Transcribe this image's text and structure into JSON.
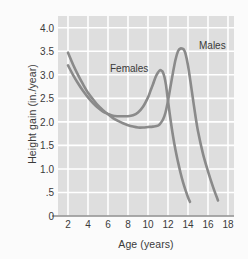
{
  "chart_data": {
    "type": "line",
    "title": "",
    "xlabel": "Age (years)",
    "ylabel": "Height gain (in./year)",
    "xlim": [
      1,
      18.6
    ],
    "ylim": [
      0,
      4.25
    ],
    "xticks": [
      "2",
      "4",
      "6",
      "8",
      "10",
      "12",
      "14",
      "16",
      "18"
    ],
    "xtick_values": [
      2,
      4,
      6,
      8,
      10,
      12,
      14,
      16,
      18
    ],
    "yticks": [
      "0",
      ".5",
      "1.0",
      "1.5",
      "2.0",
      "2.5",
      "3.0",
      "3.5",
      "4.0"
    ],
    "ytick_values": [
      0,
      0.5,
      1.0,
      1.5,
      2.0,
      2.5,
      3.0,
      3.5,
      4.0
    ],
    "grid": true,
    "grid_color": "#ffffff",
    "plot_background": "#dedede",
    "line_color": "#8a8a8a",
    "legend_position": "inline-annotations",
    "series": [
      {
        "name": "Females",
        "label_x": 10.0,
        "label_y": 3.12,
        "x": [
          2.0,
          2.5,
          3.0,
          3.5,
          4.0,
          4.5,
          5.0,
          5.5,
          6.0,
          6.5,
          7.0,
          7.5,
          8.0,
          8.5,
          9.0,
          9.5,
          10.0,
          10.25,
          10.5,
          10.75,
          11.0,
          11.2,
          11.4,
          11.5,
          11.65,
          11.8,
          12.0,
          12.25,
          12.5,
          12.75,
          13.0,
          13.25,
          13.5,
          13.75,
          14.0,
          14.2
        ],
        "y": [
          3.2,
          3.0,
          2.82,
          2.66,
          2.52,
          2.4,
          2.3,
          2.22,
          2.17,
          2.13,
          2.12,
          2.12,
          2.12,
          2.14,
          2.2,
          2.32,
          2.52,
          2.66,
          2.8,
          2.95,
          3.05,
          3.1,
          3.08,
          3.05,
          2.95,
          2.78,
          2.45,
          2.05,
          1.7,
          1.4,
          1.15,
          0.92,
          0.72,
          0.55,
          0.4,
          0.3
        ]
      },
      {
        "name": "Males",
        "label_x": 15.1,
        "label_y": 3.62,
        "x": [
          2.0,
          2.5,
          3.0,
          3.5,
          4.0,
          4.5,
          5.0,
          5.5,
          6.0,
          6.5,
          7.0,
          7.5,
          8.0,
          8.5,
          9.0,
          9.5,
          10.0,
          10.5,
          11.0,
          11.25,
          11.5,
          11.75,
          12.0,
          12.25,
          12.5,
          12.75,
          13.0,
          13.25,
          13.5,
          13.6,
          13.75,
          14.0,
          14.25,
          14.5,
          14.75,
          15.0,
          15.5,
          16.0,
          16.5,
          17.0
        ],
        "y": [
          3.47,
          3.22,
          3.0,
          2.8,
          2.62,
          2.48,
          2.35,
          2.25,
          2.16,
          2.08,
          2.02,
          1.97,
          1.93,
          1.9,
          1.88,
          1.88,
          1.89,
          1.9,
          1.92,
          1.97,
          2.05,
          2.2,
          2.45,
          2.75,
          3.05,
          3.32,
          3.5,
          3.56,
          3.55,
          3.53,
          3.45,
          3.2,
          2.85,
          2.48,
          2.12,
          1.8,
          1.32,
          0.95,
          0.62,
          0.33
        ]
      }
    ]
  }
}
